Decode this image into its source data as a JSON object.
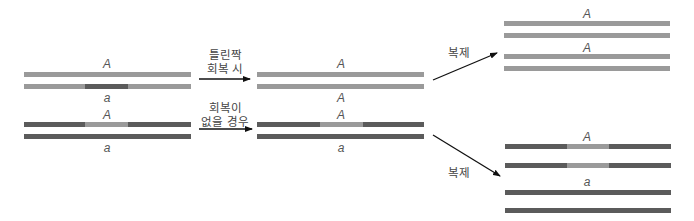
{
  "colors": {
    "light": "#9a9a9a",
    "dark": "#5b5b5b",
    "arrow": "#111111",
    "text": "#444444"
  },
  "left_group": {
    "top_pair": {
      "upper_label": "A",
      "lower_label": "a",
      "upper_strand": "light",
      "lower_strand": "light with dark mismatch segment"
    },
    "bottom_pair": {
      "upper_label": "A",
      "lower_label": "a",
      "upper_strand": "dark with light mismatch segment",
      "lower_strand": "dark"
    }
  },
  "arrows_middle": {
    "upper": {
      "line1": "틀린짝",
      "line2": "회복 시"
    },
    "lower": {
      "line1": "회복이",
      "line2": "없을 경우"
    }
  },
  "middle_group": {
    "top_pair": {
      "upper_label": "A",
      "lower_label": "A"
    },
    "bottom_pair": {
      "upper_label": "A",
      "lower_label": "a"
    }
  },
  "arrows_right": {
    "upper": {
      "label": "복제"
    },
    "lower": {
      "label": "복제"
    }
  },
  "right_group": {
    "top_set": {
      "label_1": "A",
      "label_2": "A"
    },
    "bottom_set": {
      "label_1": "A",
      "label_2": "a"
    }
  }
}
